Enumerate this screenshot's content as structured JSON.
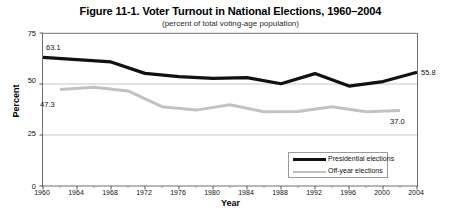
{
  "chart_data": {
    "type": "line",
    "title": "Figure 11-1. Voter Turnout in National Elections, 1960–2004",
    "subtitle": "(percent of total voting-age population)",
    "xlabel": "Year",
    "ylabel": "Percent",
    "xlim": [
      1960,
      2004
    ],
    "ylim": [
      0,
      75
    ],
    "yticks": [
      0,
      25,
      50,
      75
    ],
    "xticks": [
      1960,
      1964,
      1968,
      1972,
      1976,
      1980,
      1984,
      1988,
      1992,
      1996,
      2000,
      2004
    ],
    "grid": "horizontal",
    "legend_position": "bottom-right",
    "series": [
      {
        "name": "Presidential elections",
        "color": "#111111",
        "x": [
          1960,
          1964,
          1968,
          1972,
          1976,
          1980,
          1984,
          1988,
          1992,
          1996,
          2000,
          2004
        ],
        "values": [
          63.1,
          61.9,
          60.8,
          55.2,
          53.6,
          52.8,
          53.1,
          50.1,
          55.1,
          49.0,
          51.2,
          55.8
        ]
      },
      {
        "name": "Off-year elections",
        "color": "#c2c2c2",
        "x": [
          1962,
          1966,
          1970,
          1974,
          1978,
          1982,
          1986,
          1990,
          1994,
          1998,
          2002
        ],
        "values": [
          47.3,
          48.4,
          46.6,
          38.9,
          37.2,
          39.8,
          36.4,
          36.5,
          38.8,
          36.4,
          37.0
        ]
      }
    ],
    "annotations": [
      {
        "text": "63.1",
        "series": "Presidential elections",
        "x": 1960,
        "value": 63.1,
        "position": "above-left"
      },
      {
        "text": "55.8",
        "series": "Presidential elections",
        "x": 2004,
        "value": 55.8,
        "position": "right"
      },
      {
        "text": "47.3",
        "series": "Off-year elections",
        "x": 1962,
        "value": 47.3,
        "position": "below-left"
      },
      {
        "text": "37.0",
        "series": "Off-year elections",
        "x": 2002,
        "value": 37.0,
        "position": "below-right"
      }
    ]
  },
  "legend": {
    "items": [
      {
        "label": "Presidential elections"
      },
      {
        "label": "Off-year elections"
      }
    ]
  },
  "axis": {
    "ytick_labels": [
      "75",
      "50",
      "25",
      "0"
    ],
    "xtick_labels": [
      "1960",
      "1964",
      "1968",
      "1972",
      "1976",
      "1980",
      "1984",
      "1988",
      "1992",
      "1996",
      "2000",
      "2004"
    ]
  },
  "labels": {
    "start_presidential": "63.1",
    "end_presidential": "55.8",
    "start_offyear": "47.3",
    "end_offyear": "37.0"
  }
}
